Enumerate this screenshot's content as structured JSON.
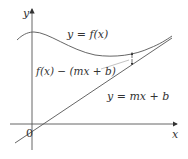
{
  "diagram": {
    "axes": {
      "x_label": "x",
      "y_label": "y",
      "origin_label": "0"
    },
    "curves": [
      {
        "name": "f",
        "label": "y = f(x)"
      },
      {
        "name": "asymptote",
        "label": "y = mx + b"
      }
    ],
    "annotation": {
      "label": "f(x) − (mx + b)"
    },
    "colors": {
      "curve": "#555555",
      "axis": "#444444",
      "text": "#333333"
    }
  }
}
